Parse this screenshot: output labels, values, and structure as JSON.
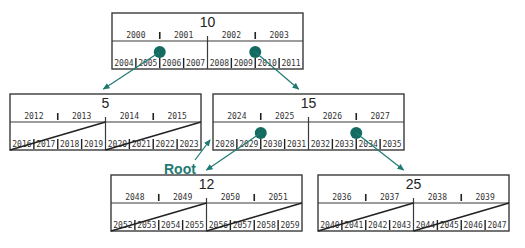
{
  "diagram": {
    "type": "btree-directory",
    "accent_color": "#1f7a72",
    "dot_color": "#146b62",
    "root_label": "Root",
    "nodes": [
      {
        "id": "n10",
        "title": "10",
        "keys": [
          "2000",
          "2001",
          "2002",
          "2003"
        ],
        "pointers": [
          "2004",
          "2005",
          "2006",
          "2007",
          "2008",
          "2009",
          "2010",
          "2011"
        ],
        "has_slashes": false,
        "dots": [
          1,
          5
        ]
      },
      {
        "id": "n5",
        "title": "5",
        "keys": [
          "2012",
          "2013",
          "2014",
          "2015"
        ],
        "pointers": [
          "2016",
          "2017",
          "2018",
          "2019",
          "2020",
          "2021",
          "2022",
          "2023"
        ],
        "has_slashes": true,
        "dots": []
      },
      {
        "id": "n15",
        "title": "15",
        "keys": [
          "2024",
          "2025",
          "2026",
          "2027"
        ],
        "pointers": [
          "2028",
          "2029",
          "2030",
          "2031",
          "2032",
          "2033",
          "2034",
          "2035"
        ],
        "has_slashes": false,
        "dots": [
          1,
          5
        ]
      },
      {
        "id": "n12",
        "title": "12",
        "keys": [
          "2048",
          "2049",
          "2050",
          "2051"
        ],
        "pointers": [
          "2052",
          "2053",
          "2054",
          "2055",
          "2056",
          "2057",
          "2058",
          "2059"
        ],
        "has_slashes": true,
        "dots": []
      },
      {
        "id": "n25",
        "title": "25",
        "keys": [
          "2036",
          "2037",
          "2038",
          "2039"
        ],
        "pointers": [
          "2040",
          "2041",
          "2042",
          "2043",
          "2044",
          "2045",
          "2046",
          "2047"
        ],
        "has_slashes": true,
        "dots": []
      }
    ],
    "edges": [
      {
        "from": "n10",
        "from_pointer": 1,
        "to": "n5"
      },
      {
        "from": "n10",
        "from_pointer": 5,
        "to": "n15"
      },
      {
        "from": "n15",
        "from_pointer": 1,
        "to": "n12"
      },
      {
        "from": "n15",
        "from_pointer": 5,
        "to": "n25"
      }
    ]
  }
}
